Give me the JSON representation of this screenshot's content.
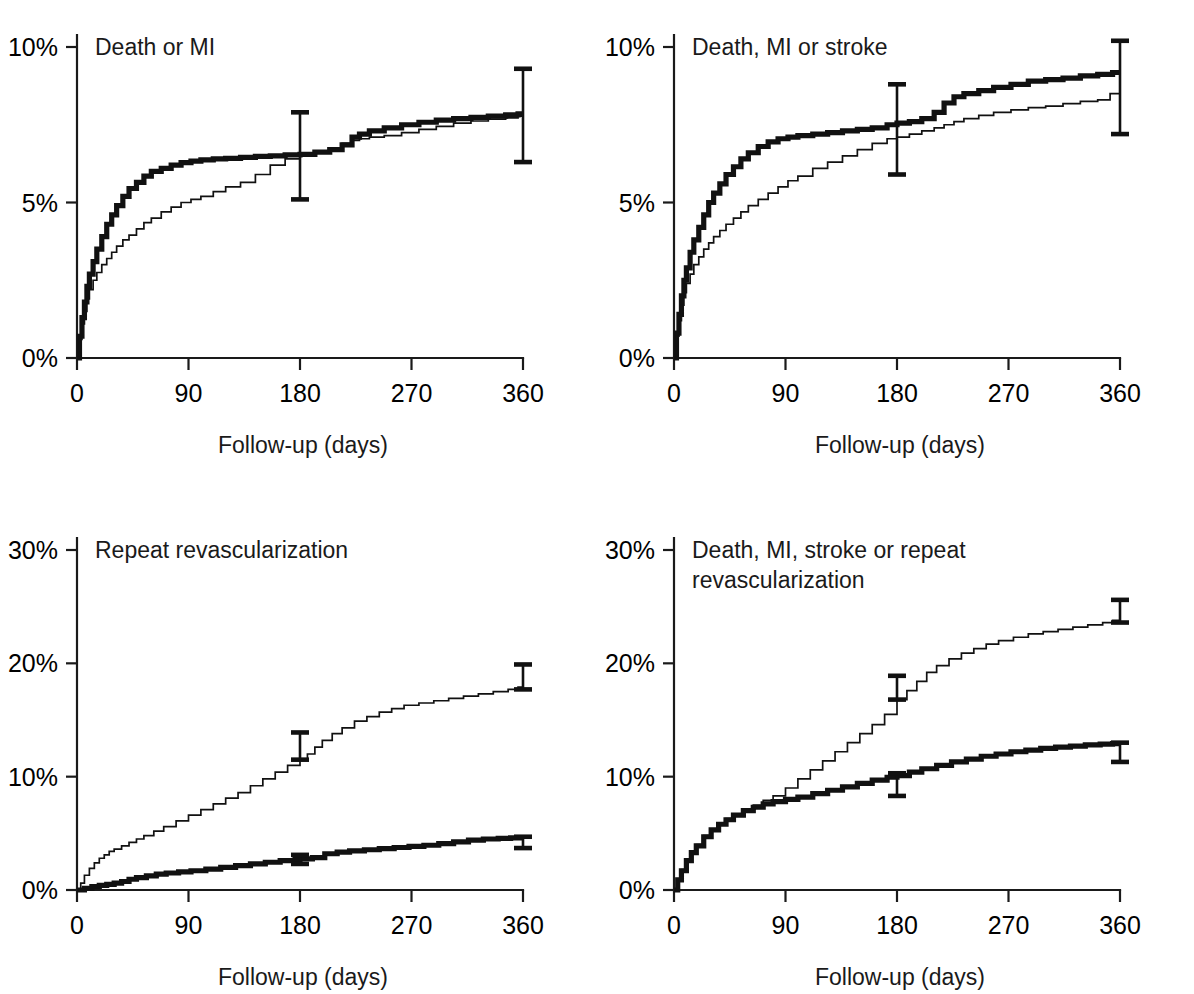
{
  "figure": {
    "background_color": "#ffffff",
    "line_color": "#111111",
    "panel_count": 4,
    "x_axis_label": "Follow-up (days)",
    "x_tick_labels": [
      "0",
      "90",
      "180",
      "270",
      "360"
    ]
  },
  "panels": {
    "p1": {
      "title": "Death or MI",
      "title_line2": "",
      "y_tick_labels": [
        "10%",
        "5%",
        "0%"
      ],
      "x_axis_label": "Follow-up (days)",
      "x_tick_labels": [
        "0",
        "90",
        "180",
        "270",
        "360"
      ]
    },
    "p2": {
      "title": "Death, MI or stroke",
      "title_line2": "",
      "y_tick_labels": [
        "10%",
        "5%",
        "0%"
      ],
      "x_axis_label": "Follow-up (days)",
      "x_tick_labels": [
        "0",
        "90",
        "180",
        "270",
        "360"
      ]
    },
    "p3": {
      "title": "Repeat revascularization",
      "title_line2": "",
      "y_tick_labels": [
        "30%",
        "20%",
        "10%",
        "0%"
      ],
      "x_axis_label": "Follow-up (days)",
      "x_tick_labels": [
        "0",
        "90",
        "180",
        "270",
        "360"
      ]
    },
    "p4": {
      "title": "Death, MI, stroke or repeat",
      "title_line2": "revascularization",
      "y_tick_labels": [
        "30%",
        "20%",
        "10%",
        "0%"
      ],
      "x_axis_label": "Follow-up (days)",
      "x_tick_labels": [
        "0",
        "90",
        "180",
        "270",
        "360"
      ]
    }
  },
  "chart_data": [
    {
      "id": "p1",
      "type": "line",
      "title": "Death or MI",
      "xlabel": "Follow-up (days)",
      "ylabel": "",
      "xlim": [
        0,
        360
      ],
      "ylim": [
        0,
        10
      ],
      "xticks": [
        0,
        90,
        180,
        270,
        360
      ],
      "yticks": [
        0,
        5,
        10
      ],
      "ytick_labels": [
        "0%",
        "5%",
        "10%"
      ],
      "grid": false,
      "legend": "none",
      "units": "percent cumulative event rate",
      "series": [
        {
          "name": "thick",
          "style": "thick",
          "x": [
            0,
            2,
            4,
            6,
            8,
            10,
            13,
            16,
            20,
            24,
            28,
            32,
            37,
            42,
            48,
            54,
            60,
            68,
            76,
            84,
            92,
            100,
            110,
            120,
            132,
            144,
            156,
            168,
            180,
            192,
            204,
            214,
            222,
            228,
            236,
            248,
            262,
            276,
            290,
            304,
            318,
            332,
            346,
            356,
            360
          ],
          "y": [
            0.0,
            0.7,
            1.3,
            1.8,
            2.3,
            2.7,
            3.1,
            3.5,
            3.9,
            4.3,
            4.6,
            4.9,
            5.2,
            5.45,
            5.65,
            5.85,
            6.0,
            6.1,
            6.2,
            6.28,
            6.33,
            6.37,
            6.4,
            6.42,
            6.45,
            6.48,
            6.5,
            6.53,
            6.55,
            6.62,
            6.7,
            6.85,
            7.1,
            7.2,
            7.3,
            7.4,
            7.5,
            7.58,
            7.65,
            7.7,
            7.74,
            7.78,
            7.82,
            7.85,
            7.85
          ]
        },
        {
          "name": "thin",
          "style": "thin",
          "x": [
            0,
            2,
            4,
            6,
            8,
            10,
            13,
            16,
            20,
            24,
            28,
            32,
            37,
            42,
            48,
            54,
            60,
            68,
            76,
            84,
            92,
            100,
            110,
            120,
            132,
            144,
            156,
            168,
            180,
            192,
            204,
            214,
            222,
            228,
            236,
            248,
            262,
            276,
            290,
            304,
            318,
            332,
            346,
            356,
            360
          ],
          "y": [
            0.0,
            0.6,
            1.1,
            1.5,
            1.9,
            2.2,
            2.5,
            2.75,
            3.0,
            3.2,
            3.4,
            3.6,
            3.8,
            3.95,
            4.15,
            4.35,
            4.5,
            4.7,
            4.85,
            5.0,
            5.1,
            5.2,
            5.35,
            5.5,
            5.65,
            5.9,
            6.2,
            6.4,
            6.5,
            6.6,
            6.7,
            6.9,
            7.0,
            7.05,
            7.1,
            7.15,
            7.25,
            7.35,
            7.45,
            7.55,
            7.62,
            7.68,
            7.72,
            7.78,
            7.78
          ]
        }
      ],
      "error_bars": [
        {
          "x": 180,
          "center": 6.5,
          "low": 5.1,
          "high": 7.9
        },
        {
          "x": 360,
          "center": 7.8,
          "low": 6.3,
          "high": 9.3
        }
      ]
    },
    {
      "id": "p2",
      "type": "line",
      "title": "Death, MI or stroke",
      "xlabel": "Follow-up (days)",
      "ylabel": "",
      "xlim": [
        0,
        360
      ],
      "ylim": [
        0,
        10
      ],
      "xticks": [
        0,
        90,
        180,
        270,
        360
      ],
      "yticks": [
        0,
        5,
        10
      ],
      "ytick_labels": [
        "0%",
        "5%",
        "10%"
      ],
      "grid": false,
      "legend": "none",
      "units": "percent cumulative event rate",
      "series": [
        {
          "name": "thick",
          "style": "thick",
          "x": [
            0,
            2,
            4,
            6,
            8,
            10,
            13,
            16,
            20,
            24,
            28,
            32,
            37,
            42,
            48,
            54,
            60,
            68,
            76,
            84,
            92,
            100,
            112,
            124,
            136,
            148,
            160,
            172,
            180,
            190,
            200,
            210,
            218,
            226,
            234,
            246,
            258,
            272,
            286,
            300,
            314,
            328,
            342,
            354,
            360
          ],
          "y": [
            0.0,
            0.8,
            1.4,
            2.0,
            2.5,
            2.9,
            3.4,
            3.8,
            4.2,
            4.6,
            5.0,
            5.3,
            5.6,
            5.9,
            6.15,
            6.4,
            6.6,
            6.8,
            6.95,
            7.05,
            7.1,
            7.15,
            7.2,
            7.25,
            7.3,
            7.35,
            7.4,
            7.5,
            7.55,
            7.6,
            7.7,
            7.9,
            8.2,
            8.4,
            8.5,
            8.6,
            8.7,
            8.8,
            8.9,
            8.95,
            9.0,
            9.07,
            9.12,
            9.18,
            9.18
          ]
        },
        {
          "name": "thin",
          "style": "thin",
          "x": [
            0,
            2,
            4,
            6,
            8,
            10,
            13,
            16,
            20,
            24,
            28,
            32,
            37,
            42,
            48,
            54,
            60,
            68,
            76,
            84,
            92,
            100,
            112,
            124,
            136,
            148,
            160,
            172,
            180,
            190,
            200,
            210,
            218,
            226,
            234,
            246,
            258,
            272,
            286,
            300,
            314,
            328,
            342,
            352,
            360
          ],
          "y": [
            0.0,
            0.7,
            1.2,
            1.7,
            2.1,
            2.4,
            2.7,
            3.0,
            3.25,
            3.5,
            3.7,
            3.9,
            4.1,
            4.3,
            4.5,
            4.7,
            4.9,
            5.1,
            5.3,
            5.5,
            5.7,
            5.85,
            6.1,
            6.3,
            6.5,
            6.7,
            6.9,
            7.05,
            7.1,
            7.2,
            7.3,
            7.4,
            7.5,
            7.6,
            7.7,
            7.8,
            7.9,
            7.98,
            8.05,
            8.1,
            8.18,
            8.25,
            8.3,
            8.5,
            8.5
          ]
        }
      ],
      "error_bars": [
        {
          "x": 180,
          "center": 7.3,
          "low": 5.9,
          "high": 8.8
        },
        {
          "x": 360,
          "center": 9.2,
          "low": 7.2,
          "high": 10.2
        }
      ]
    },
    {
      "id": "p3",
      "type": "line",
      "title": "Repeat revascularization",
      "xlabel": "Follow-up (days)",
      "ylabel": "",
      "xlim": [
        0,
        360
      ],
      "ylim": [
        0,
        30
      ],
      "xticks": [
        0,
        90,
        180,
        270,
        360
      ],
      "yticks": [
        0,
        10,
        20,
        30
      ],
      "ytick_labels": [
        "0%",
        "10%",
        "20%",
        "30%"
      ],
      "grid": false,
      "legend": "none",
      "units": "percent cumulative event rate",
      "series": [
        {
          "name": "thin",
          "style": "thin",
          "x": [
            0,
            3,
            6,
            10,
            14,
            18,
            22,
            26,
            30,
            36,
            42,
            48,
            54,
            62,
            70,
            80,
            90,
            100,
            110,
            120,
            130,
            140,
            150,
            160,
            170,
            180,
            186,
            192,
            198,
            206,
            214,
            224,
            234,
            244,
            254,
            264,
            276,
            288,
            300,
            312,
            324,
            336,
            348,
            356,
            360
          ],
          "y": [
            0.0,
            0.6,
            1.3,
            1.9,
            2.4,
            2.8,
            3.1,
            3.4,
            3.6,
            3.9,
            4.2,
            4.5,
            4.8,
            5.2,
            5.6,
            6.1,
            6.6,
            7.1,
            7.6,
            8.1,
            8.6,
            9.2,
            9.8,
            10.4,
            11.0,
            11.5,
            12.0,
            12.6,
            13.2,
            13.8,
            14.3,
            14.9,
            15.3,
            15.7,
            16.0,
            16.3,
            16.5,
            16.7,
            16.9,
            17.1,
            17.3,
            17.5,
            17.7,
            17.9,
            17.9
          ]
        },
        {
          "name": "thick",
          "style": "thick",
          "x": [
            0,
            6,
            12,
            18,
            24,
            30,
            36,
            42,
            48,
            56,
            64,
            72,
            82,
            92,
            104,
            116,
            128,
            140,
            152,
            164,
            176,
            180,
            190,
            200,
            210,
            220,
            232,
            244,
            256,
            268,
            280,
            292,
            304,
            316,
            328,
            340,
            350,
            356,
            360
          ],
          "y": [
            0.0,
            0.15,
            0.3,
            0.4,
            0.5,
            0.6,
            0.75,
            0.95,
            1.1,
            1.25,
            1.4,
            1.5,
            1.6,
            1.7,
            1.85,
            2.0,
            2.15,
            2.3,
            2.45,
            2.6,
            2.7,
            2.75,
            2.85,
            3.2,
            3.35,
            3.45,
            3.55,
            3.65,
            3.75,
            3.85,
            3.95,
            4.1,
            4.25,
            4.4,
            4.5,
            4.55,
            4.6,
            4.6,
            4.6
          ]
        }
      ],
      "error_bars": [
        {
          "x": 180,
          "center": 12.7,
          "low": 11.5,
          "high": 13.9
        },
        {
          "x": 180,
          "center": 2.7,
          "low": 2.3,
          "high": 3.1
        },
        {
          "x": 360,
          "center": 18.8,
          "low": 17.7,
          "high": 19.9
        },
        {
          "x": 360,
          "center": 4.2,
          "low": 3.7,
          "high": 4.7
        }
      ]
    },
    {
      "id": "p4",
      "type": "line",
      "title": "Death, MI, stroke or repeat revascularization",
      "xlabel": "Follow-up (days)",
      "ylabel": "",
      "xlim": [
        0,
        360
      ],
      "ylim": [
        0,
        30
      ],
      "xticks": [
        0,
        90,
        180,
        270,
        360
      ],
      "yticks": [
        0,
        10,
        20,
        30
      ],
      "ytick_labels": [
        "0%",
        "10%",
        "20%",
        "30%"
      ],
      "grid": false,
      "legend": "none",
      "units": "percent cumulative event rate",
      "series": [
        {
          "name": "thin",
          "style": "thin",
          "x": [
            0,
            3,
            6,
            10,
            14,
            18,
            24,
            30,
            36,
            42,
            48,
            56,
            64,
            72,
            80,
            90,
            100,
            110,
            120,
            130,
            140,
            150,
            160,
            170,
            180,
            188,
            196,
            204,
            212,
            222,
            232,
            242,
            252,
            262,
            274,
            286,
            298,
            310,
            322,
            334,
            346,
            354,
            360
          ],
          "y": [
            0.0,
            0.9,
            1.8,
            2.7,
            3.4,
            4.0,
            4.8,
            5.4,
            5.9,
            6.3,
            6.7,
            7.1,
            7.5,
            7.9,
            8.3,
            9.0,
            9.8,
            10.6,
            11.4,
            12.2,
            13.0,
            13.8,
            14.6,
            15.5,
            16.8,
            17.6,
            18.4,
            19.2,
            19.8,
            20.4,
            20.9,
            21.3,
            21.7,
            22.0,
            22.3,
            22.6,
            22.8,
            23.0,
            23.2,
            23.4,
            23.6,
            23.8,
            23.8
          ]
        },
        {
          "name": "thick",
          "style": "thick",
          "x": [
            0,
            3,
            6,
            10,
            14,
            18,
            24,
            30,
            36,
            42,
            48,
            56,
            64,
            72,
            80,
            90,
            100,
            112,
            124,
            136,
            148,
            160,
            172,
            180,
            190,
            200,
            212,
            224,
            236,
            248,
            260,
            272,
            284,
            296,
            308,
            320,
            332,
            344,
            354,
            360
          ],
          "y": [
            0.0,
            0.9,
            1.7,
            2.6,
            3.3,
            3.9,
            4.7,
            5.3,
            5.8,
            6.2,
            6.6,
            7.0,
            7.3,
            7.6,
            7.8,
            8.0,
            8.2,
            8.5,
            8.8,
            9.1,
            9.4,
            9.7,
            9.95,
            10.1,
            10.4,
            10.7,
            11.0,
            11.3,
            11.55,
            11.8,
            12.0,
            12.2,
            12.35,
            12.5,
            12.6,
            12.7,
            12.8,
            12.88,
            12.92,
            12.92
          ]
        }
      ],
      "error_bars": [
        {
          "x": 180,
          "center": 17.7,
          "low": 16.8,
          "high": 18.9
        },
        {
          "x": 180,
          "center": 9.3,
          "low": 8.3,
          "high": 10.3
        },
        {
          "x": 360,
          "center": 24.5,
          "low": 23.6,
          "high": 25.6
        },
        {
          "x": 360,
          "center": 12.2,
          "low": 11.3,
          "high": 13.0
        }
      ]
    }
  ]
}
